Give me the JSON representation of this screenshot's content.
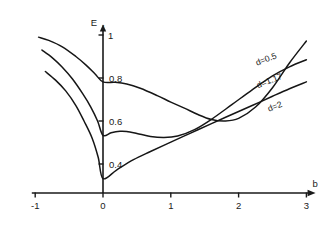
{
  "chart_data": {
    "type": "line",
    "title": "",
    "subtitle": "",
    "xlabel": "b",
    "ylabel": "E",
    "ylabel_subscript": "1",
    "xlim": [
      -1.05,
      3.15
    ],
    "ylim": [
      0.26,
      1.04
    ],
    "grid": false,
    "legend_position": "inline-right-of-curves",
    "xticks": [
      -1,
      0,
      1,
      2,
      3
    ],
    "xticklabels": [
      "-1",
      "0",
      "1",
      "2",
      "3"
    ],
    "yticks": [
      0.4,
      0.6,
      0.8,
      1.0
    ],
    "yticklabels": [
      "0.4",
      "0.6",
      "0.8",
      "1"
    ],
    "series": [
      {
        "name": "d=0.5",
        "label": "d=0.5",
        "label_x": 2.42,
        "label_y": 0.875,
        "label_rotation": -21,
        "x": [
          -0.95,
          -0.8,
          -0.6,
          -0.4,
          -0.25,
          -0.12,
          0.0,
          0.18,
          0.35,
          0.55,
          0.8,
          1.0,
          1.2,
          1.4,
          1.6,
          1.8,
          2.0,
          2.25,
          2.5,
          2.75,
          3.0
        ],
        "y": [
          0.99,
          0.975,
          0.945,
          0.9,
          0.86,
          0.82,
          0.782,
          0.78,
          0.772,
          0.752,
          0.718,
          0.688,
          0.66,
          0.63,
          0.607,
          0.6,
          0.612,
          0.665,
          0.755,
          0.87,
          0.972
        ]
      },
      {
        "name": "d=1.17",
        "label": "d=1.17",
        "label_x": 2.47,
        "label_y": 0.775,
        "label_rotation": -21,
        "x": [
          -0.9,
          -0.75,
          -0.6,
          -0.45,
          -0.3,
          -0.18,
          -0.08,
          0.0,
          0.12,
          0.25,
          0.35,
          0.5,
          0.7,
          0.9,
          1.1,
          1.35,
          1.6,
          1.9,
          2.2,
          2.5,
          2.75,
          3.0
        ],
        "y": [
          0.93,
          0.895,
          0.85,
          0.795,
          0.727,
          0.665,
          0.6,
          0.533,
          0.545,
          0.552,
          0.551,
          0.542,
          0.528,
          0.523,
          0.53,
          0.56,
          0.608,
          0.676,
          0.745,
          0.81,
          0.852,
          0.885
        ]
      },
      {
        "name": "d=2",
        "label": "d=2",
        "label_x": 2.55,
        "label_y": 0.655,
        "label_rotation": -21,
        "x": [
          -0.85,
          -0.7,
          -0.55,
          -0.4,
          -0.28,
          -0.16,
          -0.07,
          0.0,
          0.2,
          0.45,
          0.7,
          1.0,
          1.3,
          1.6,
          1.9,
          2.2,
          2.5,
          2.75,
          3.0
        ],
        "y": [
          0.83,
          0.79,
          0.74,
          0.672,
          0.6,
          0.52,
          0.43,
          0.332,
          0.372,
          0.42,
          0.458,
          0.502,
          0.545,
          0.588,
          0.63,
          0.672,
          0.715,
          0.75,
          0.782
        ]
      }
    ]
  },
  "axes": {
    "x_axis_name": "b-axis",
    "y_axis_name": "E1-axis"
  }
}
